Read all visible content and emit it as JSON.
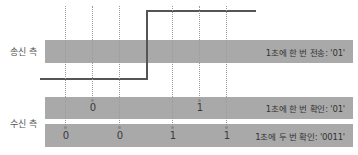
{
  "sender": {
    "label": "송신 측",
    "bar_text": "1초에 한 번 전송: '01'"
  },
  "receiver": {
    "label": "수신 측",
    "bar1_text": "1초에 한 번 확인: '01'",
    "bar2_text": "1초에 두 번 확인: '0011'",
    "bar1_samples": [
      "0",
      "1"
    ],
    "bar2_samples": [
      "0",
      "0",
      "1",
      "1"
    ]
  },
  "signal": {
    "low_value": "0",
    "high_value": "1",
    "color": "#555555"
  },
  "colors": {
    "bar": "#a9a9a9",
    "dash": "#9a9a9a"
  }
}
